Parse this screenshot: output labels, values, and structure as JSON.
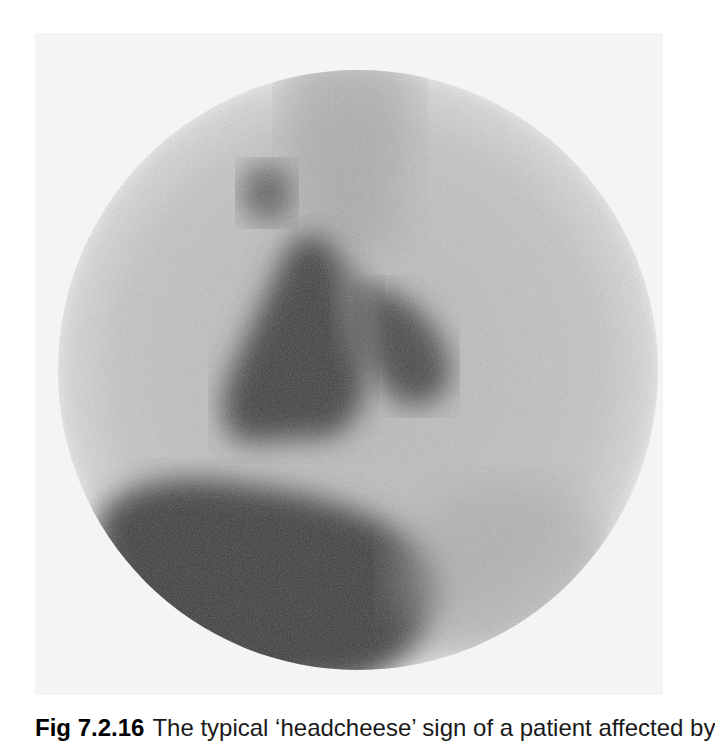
{
  "figure": {
    "type": "nuclear medicine scintigraphy (gamma camera) image",
    "background_color": "#f4f4f4",
    "field_of_view": "circular",
    "regions": [
      {
        "name": "central-triangular-uptake",
        "description": "dark triangular/inverted-V area of uptake in center"
      },
      {
        "name": "left-upper-focal-uptake",
        "description": "small dark focus above left of center"
      },
      {
        "name": "right-lobe-uptake",
        "description": "dark lobe right of center"
      },
      {
        "name": "lower-left-large-uptake",
        "description": "large dark crescent region in lower field"
      }
    ],
    "colors": {
      "dark_uptake": "#3a3a3a",
      "medium_uptake": "#8c8c8c",
      "background_field": "#c8c8c8"
    }
  },
  "caption": {
    "label": "Fig 7.2.16",
    "text": "The typical ‘headcheese’ sign of a patient affected by"
  }
}
